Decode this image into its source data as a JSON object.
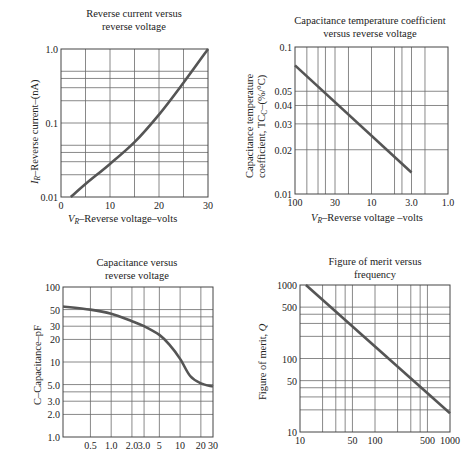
{
  "chart_data": [
    {
      "id": "reverse_current",
      "type": "line",
      "title": "Reverse current versus reverse voltage",
      "title_lines": [
        "Reverse current versus",
        "reverse voltage"
      ],
      "xlabel": "V_R–Reverse voltage–volts",
      "xlabel_main": "V",
      "xlabel_sub": "R",
      "xlabel_rest": "–Reverse voltage–volts",
      "ylabel": "I_R–Reverse current–(nA)",
      "ylabel_main": "I",
      "ylabel_sub": "R",
      "ylabel_rest": "–Reverse current–(nA)",
      "xscale": "linear",
      "yscale": "log",
      "xlim": [
        0,
        30
      ],
      "ylim": [
        0.01,
        1.0
      ],
      "xticks": [
        "0",
        "10",
        "20",
        "30"
      ],
      "yticks": [
        "0.01",
        "0.1",
        "1.0"
      ],
      "grid": true,
      "x": [
        2,
        5,
        10,
        15,
        20,
        25,
        30
      ],
      "y": [
        0.01,
        0.015,
        0.028,
        0.055,
        0.13,
        0.35,
        1.0
      ]
    },
    {
      "id": "cap_temp_coeff",
      "type": "line",
      "title": "Capacitance temperature coefficient versus reverse voltage",
      "title_lines": [
        "Capacitance temperature coefficient",
        "versus reverse voltage"
      ],
      "xlabel": "V_R–Reverse voltage –volts",
      "xlabel_main": "V",
      "xlabel_sub": "R",
      "xlabel_rest": "–Reverse voltage –volts",
      "ylabel": "Capacitance temperature coefficient, TC_C–(%/°C)",
      "ylabel_line1": "Capacitance temperature",
      "ylabel_line2_a": "coefficient, TC",
      "ylabel_line2_sub": "C",
      "ylabel_line2_b": "–(%/°C)",
      "xscale": "log",
      "x_reversed": true,
      "yscale": "log",
      "xlim": [
        100,
        1.0
      ],
      "ylim": [
        0.01,
        0.1
      ],
      "xticks": [
        "100",
        "30",
        "10",
        "3.0",
        "1.0"
      ],
      "yticks": [
        "0.01",
        "0.02",
        "0.03",
        "0.04",
        "0.05",
        "0.1"
      ],
      "grid": true,
      "x": [
        100,
        3
      ],
      "y": [
        0.075,
        0.014
      ]
    },
    {
      "id": "capacitance",
      "type": "line",
      "title": "Capacitance versus reverse voltage",
      "title_lines": [
        "Capacitance versus",
        "reverse voltage"
      ],
      "xlabel": "",
      "ylabel": "C–Capacitance–pF",
      "xscale": "log",
      "yscale": "log",
      "xlim": [
        0.2,
        30
      ],
      "ylim": [
        1.0,
        100
      ],
      "xticks": [
        "0.5",
        "1.0",
        "2.0",
        "3.0",
        "5",
        "10",
        "20",
        "30"
      ],
      "yticks": [
        "1.0",
        "2.0",
        "3.0",
        "5.0",
        "10",
        "20",
        "30",
        "50",
        "100"
      ],
      "grid": true,
      "x": [
        0.2,
        0.5,
        1.0,
        2.0,
        3.0,
        5.0,
        7.0,
        10,
        14,
        20,
        30
      ],
      "y": [
        55,
        50,
        44,
        35,
        30,
        23,
        17,
        11,
        6.5,
        5.2,
        4.7
      ]
    },
    {
      "id": "figure_of_merit",
      "type": "line",
      "title": "Figure of merit versus frequency",
      "title_lines": [
        "Figure of merit versus",
        "frequency"
      ],
      "xlabel": "",
      "ylabel": "Figure of merit, Q",
      "ylabel_a": "Figure of merit, ",
      "ylabel_b": "Q",
      "xscale": "log",
      "yscale": "log",
      "xlim": [
        10,
        1000
      ],
      "ylim": [
        10,
        1000
      ],
      "xticks": [
        "10",
        "50",
        "100",
        "500",
        "1000"
      ],
      "yticks": [
        "10",
        "50",
        "100",
        "500",
        "1000"
      ],
      "grid": true,
      "x": [
        12,
        1000
      ],
      "y": [
        1000,
        18
      ]
    }
  ],
  "style": {
    "curve_color": "#555555",
    "grid_color": "#6b6b6b",
    "text_color": "#222222"
  }
}
